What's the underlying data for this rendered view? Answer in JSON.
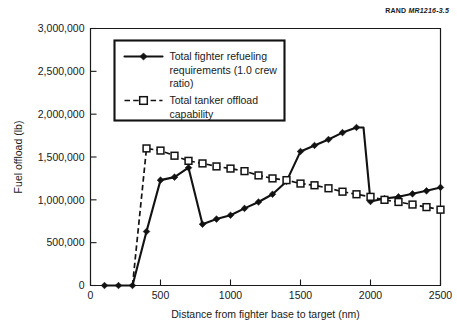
{
  "source_label": {
    "prefix": "RAND",
    "code": "MR1216-3.5"
  },
  "chart_data": {
    "type": "line",
    "title": "",
    "xlabel": "Distance from fighter base to target (nm)",
    "ylabel": "Fuel offload (lb)",
    "xlim": [
      0,
      2500
    ],
    "ylim": [
      0,
      3000000
    ],
    "xticks": [
      0,
      500,
      1000,
      1500,
      2000,
      2500
    ],
    "xticklabels": [
      "0",
      "500",
      "1000",
      "1500",
      "2000",
      "2500"
    ],
    "yticks": [
      0,
      500000,
      1000000,
      1500000,
      2000000,
      2500000,
      3000000
    ],
    "yticklabels": [
      "0",
      "500,000",
      "1,000,000",
      "1,500,000",
      "2,000,000",
      "2,500,000",
      "3,000,000"
    ],
    "grid": false,
    "legend_position": "upper left",
    "series": [
      {
        "name": "Total fighter refueling requirements (1.0 crew ratio)",
        "marker": "filled-diamond",
        "linestyle": "solid",
        "x": [
          100,
          200,
          300,
          400,
          500,
          600,
          700,
          800,
          900,
          1000,
          1100,
          1200,
          1300,
          1400,
          1500,
          1600,
          1700,
          1800,
          1900,
          1950,
          2000,
          2100,
          2200,
          2300,
          2400,
          2500
        ],
        "values": [
          0,
          0,
          0,
          630000,
          1230000,
          1265000,
          1375000,
          715000,
          775000,
          820000,
          900000,
          975000,
          1065000,
          1215000,
          1565000,
          1635000,
          1705000,
          1785000,
          1845000,
          1845000,
          980000,
          1015000,
          1035000,
          1070000,
          1105000,
          1145000
        ]
      },
      {
        "name": "Total tanker offload capability",
        "marker": "open-square",
        "linestyle": "dashed",
        "x": [
          300,
          400,
          500,
          600,
          700,
          800,
          900,
          1000,
          1100,
          1200,
          1300,
          1400,
          1500,
          1600,
          1700,
          1800,
          1900,
          2000,
          2100,
          2200,
          2300,
          2400,
          2500
        ],
        "values": [
          0,
          1600000,
          1575000,
          1515000,
          1455000,
          1425000,
          1390000,
          1365000,
          1335000,
          1285000,
          1250000,
          1230000,
          1190000,
          1170000,
          1135000,
          1095000,
          1065000,
          1035000,
          1000000,
          975000,
          945000,
          915000,
          885000
        ]
      }
    ],
    "legend_entries": [
      {
        "lines": [
          "Total fighter refueling",
          "requirements (1.0 crew",
          "ratio)"
        ]
      },
      {
        "lines": [
          "Total tanker offload",
          "capability"
        ]
      }
    ]
  }
}
